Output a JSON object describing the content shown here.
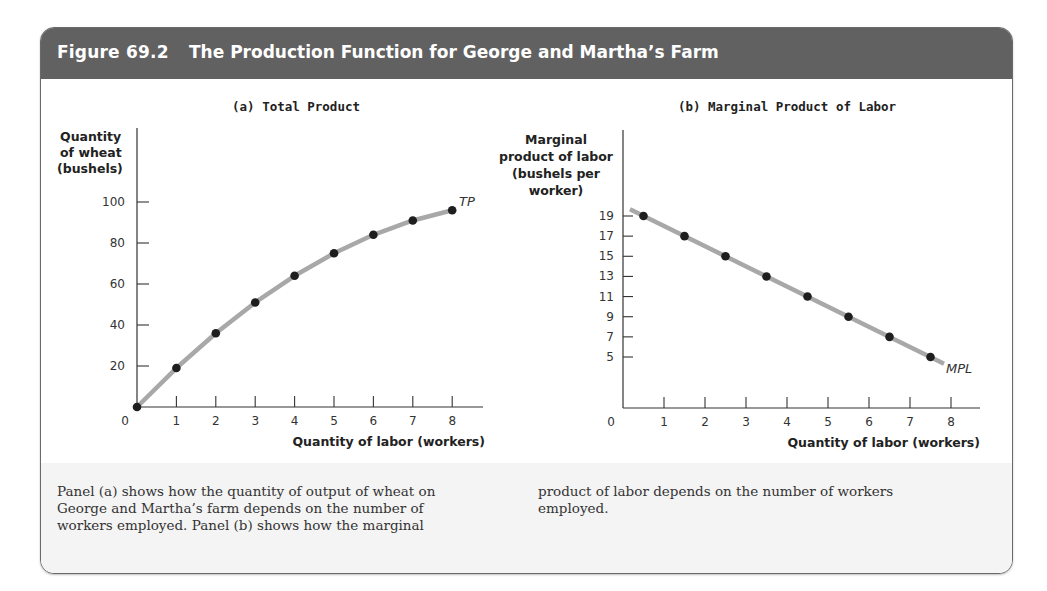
{
  "figure": {
    "number": "Figure 69.2",
    "title": "The Production Function for George and Martha’s Farm",
    "colors": {
      "header_bg": "#616161",
      "curve": "#a8a8a8",
      "point": "#1e1e1e",
      "caption_bg": "#f4f4f4"
    }
  },
  "panel_a": {
    "title": "(a) Total Product",
    "ylabel_lines": [
      "Quantity",
      "of wheat",
      "(bushels)"
    ],
    "xlabel": "Quantity of labor (workers)",
    "origin_label": "0",
    "curve_label": "TP"
  },
  "panel_b": {
    "title": "(b) Marginal Product of Labor",
    "ylabel_lines": [
      "Marginal",
      "product of labor",
      "(bushels per",
      "worker)"
    ],
    "xlabel": "Quantity of labor (workers)",
    "origin_label": "0",
    "curve_label": "MPL"
  },
  "caption": {
    "left": "Panel (a) shows how the quantity of output of wheat on George and Martha’s farm depends on the number of workers employed. Panel (b) shows how the marginal",
    "left_lines": [
      "Panel (a) shows how the quantity of output of wheat on",
      "George and Martha’s farm depends on the number of",
      "workers employed. Panel (b) shows how the marginal"
    ],
    "right_lines": [
      "product of labor depends on the number of workers",
      "employed."
    ]
  },
  "chart_data": [
    {
      "type": "line",
      "title": "(a) Total Product",
      "xlabel": "Quantity of labor (workers)",
      "ylabel": "Quantity of wheat (bushels)",
      "x": [
        0,
        1,
        2,
        3,
        4,
        5,
        6,
        7,
        8
      ],
      "series": [
        {
          "name": "TP",
          "values": [
            0,
            19,
            36,
            51,
            64,
            75,
            84,
            91,
            96
          ]
        }
      ],
      "x_ticks": [
        1,
        2,
        3,
        4,
        5,
        6,
        7,
        8
      ],
      "y_ticks": [
        20,
        40,
        60,
        80,
        100
      ],
      "xlim": [
        0,
        8.7
      ],
      "ylim": [
        0,
        120
      ],
      "grid": false,
      "markers": true
    },
    {
      "type": "line",
      "title": "(b) Marginal Product of Labor",
      "xlabel": "Quantity of labor (workers)",
      "ylabel": "Marginal product of labor (bushels per worker)",
      "x": [
        0.5,
        1.5,
        2.5,
        3.5,
        4.5,
        5.5,
        6.5,
        7.5
      ],
      "series": [
        {
          "name": "MPL",
          "values": [
            19,
            17,
            15,
            13,
            11,
            9,
            7,
            5
          ]
        }
      ],
      "x_ticks": [
        1,
        2,
        3,
        4,
        5,
        6,
        7,
        8
      ],
      "y_ticks": [
        5,
        7,
        9,
        11,
        13,
        15,
        17,
        19
      ],
      "xlim": [
        0,
        8.7
      ],
      "ylim": [
        0,
        28
      ],
      "grid": false,
      "markers": true
    }
  ]
}
